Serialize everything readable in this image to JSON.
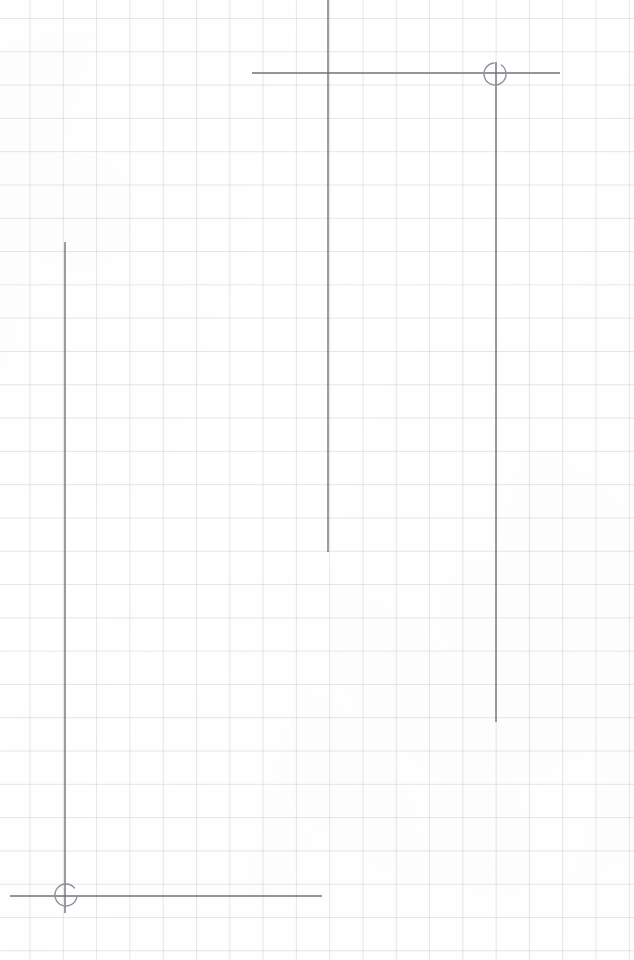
{
  "document": {
    "title": "Graph Paper Technical Sketch",
    "medium": "pencil on quadrille graph paper",
    "width": 634,
    "height": 960
  },
  "canvas": {
    "background_color": "#ffffff",
    "grid": {
      "visible": true,
      "color": "#96a0af",
      "opacity": 0.26,
      "cell_size_px": 33.3,
      "origin_x_px": 29.5,
      "origin_y_px": 18,
      "line_width_px": 1
    }
  },
  "ink": {
    "color": "#6e7278",
    "stroke_width": 1.4,
    "light_color": "#8d9299"
  },
  "strokes": [
    {
      "id": "upper-vertical-long",
      "name": "upper-left-vertical-stroke",
      "type": "line",
      "x1": 328,
      "y1": 0,
      "x2": 328,
      "y2": 552
    },
    {
      "id": "upper-horizontal",
      "name": "upper-horizontal-stroke",
      "type": "line",
      "x1": 252,
      "y1": 73,
      "x2": 560,
      "y2": 73
    },
    {
      "id": "right-vertical",
      "name": "right-vertical-stroke",
      "type": "line",
      "x1": 496,
      "y1": 62,
      "x2": 496,
      "y2": 722
    },
    {
      "id": "left-vertical",
      "name": "left-vertical-stroke",
      "type": "line",
      "x1": 65,
      "y1": 242,
      "x2": 65,
      "y2": 913
    },
    {
      "id": "lower-horizontal",
      "name": "lower-horizontal-stroke",
      "type": "line",
      "x1": 10,
      "y1": 896,
      "x2": 322,
      "y2": 896
    }
  ],
  "markers": [
    {
      "id": "joint-top-right",
      "name": "top-right-circle-marker",
      "type": "arc",
      "cx": 495,
      "cy": 74,
      "r": 11,
      "gap_description": "open arc, gap in upper-right quadrant",
      "start_deg": -55,
      "end_deg": 265
    },
    {
      "id": "joint-bottom-left",
      "name": "bottom-left-circle-marker",
      "type": "arc",
      "cx": 66,
      "cy": 895,
      "r": 11,
      "gap_description": "open arc, gap in lower-left quadrant",
      "start_deg": 10,
      "end_deg": 320
    }
  ],
  "annotations": {
    "count_label": "",
    "caption": ""
  }
}
